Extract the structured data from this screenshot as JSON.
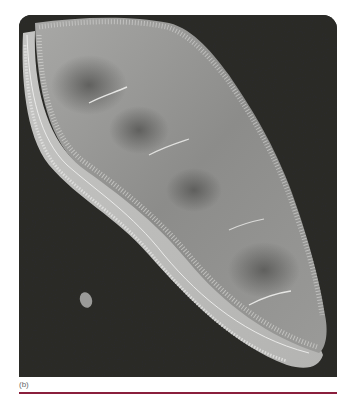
{
  "figure": {
    "caption_label": "(b)",
    "rule_color": "#8a1f3c",
    "background_color": "#2a2a28"
  }
}
